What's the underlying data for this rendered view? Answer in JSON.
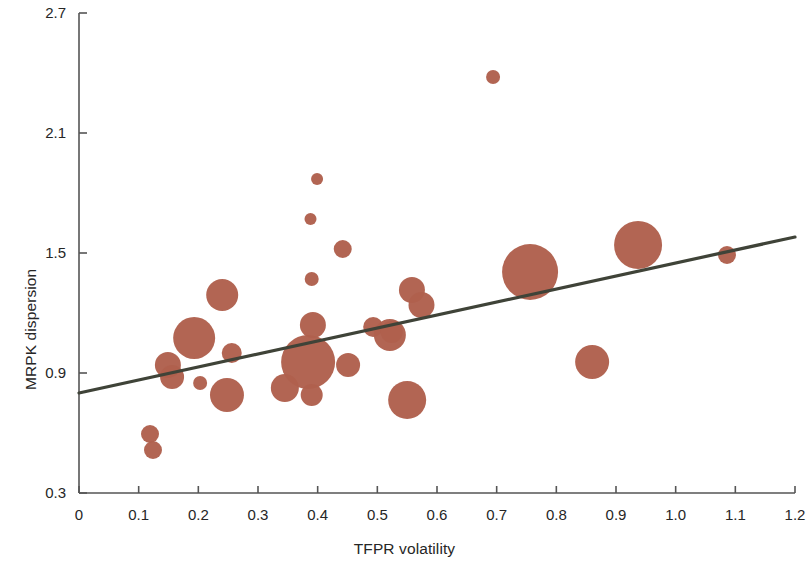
{
  "chart_data": {
    "type": "scatter",
    "title": "",
    "xlabel": "TFPR volatility",
    "ylabel": "MRPK dispersion",
    "xlim": [
      0,
      1.2
    ],
    "ylim": [
      0.3,
      2.7
    ],
    "xticks": [
      0,
      0.1,
      0.2,
      0.3,
      0.4,
      0.5,
      0.6,
      0.7,
      0.8,
      0.9,
      1.0,
      1.1,
      1.2
    ],
    "xticklabels": [
      "0",
      "0.1",
      "0.2",
      "0.3",
      "0.4",
      "0.5",
      "0.6",
      "0.7",
      "0.8",
      "0.9",
      "1.0",
      "1.1",
      "1.2"
    ],
    "yticks": [
      0.3,
      0.9,
      1.5,
      2.1,
      2.7
    ],
    "yticklabels": [
      "0.3",
      "0.9",
      "1.5",
      "2.1",
      "2.7"
    ],
    "grid": false,
    "legend": null,
    "marker_color": "#b0604d",
    "trendline_color": "#3f4338",
    "bubble_size_encodes": "weight",
    "trendline": {
      "x": [
        0,
        1.2
      ],
      "y": [
        0.8,
        1.58
      ]
    },
    "points": [
      {
        "x": 0.119,
        "y": 0.595,
        "r": 9
      },
      {
        "x": 0.124,
        "y": 0.515,
        "r": 9
      },
      {
        "x": 0.149,
        "y": 0.94,
        "r": 13
      },
      {
        "x": 0.156,
        "y": 0.88,
        "r": 12
      },
      {
        "x": 0.193,
        "y": 1.075,
        "r": 21
      },
      {
        "x": 0.203,
        "y": 0.85,
        "r": 7
      },
      {
        "x": 0.24,
        "y": 1.29,
        "r": 16
      },
      {
        "x": 0.256,
        "y": 1.0,
        "r": 10
      },
      {
        "x": 0.248,
        "y": 0.79,
        "r": 17
      },
      {
        "x": 0.345,
        "y": 0.825,
        "r": 14
      },
      {
        "x": 0.384,
        "y": 0.955,
        "r": 27
      },
      {
        "x": 0.39,
        "y": 0.79,
        "r": 11
      },
      {
        "x": 0.392,
        "y": 1.14,
        "r": 13
      },
      {
        "x": 0.39,
        "y": 1.37,
        "r": 7
      },
      {
        "x": 0.388,
        "y": 1.67,
        "r": 6
      },
      {
        "x": 0.399,
        "y": 1.87,
        "r": 6
      },
      {
        "x": 0.442,
        "y": 1.52,
        "r": 9
      },
      {
        "x": 0.451,
        "y": 0.94,
        "r": 12
      },
      {
        "x": 0.493,
        "y": 1.13,
        "r": 10
      },
      {
        "x": 0.521,
        "y": 1.09,
        "r": 16
      },
      {
        "x": 0.524,
        "y": 1.105,
        "r": 11
      },
      {
        "x": 0.558,
        "y": 1.315,
        "r": 13
      },
      {
        "x": 0.574,
        "y": 1.24,
        "r": 13
      },
      {
        "x": 0.55,
        "y": 0.765,
        "r": 19
      },
      {
        "x": 0.694,
        "y": 2.38,
        "r": 7
      },
      {
        "x": 0.756,
        "y": 1.405,
        "r": 28
      },
      {
        "x": 0.86,
        "y": 0.955,
        "r": 17
      },
      {
        "x": 0.937,
        "y": 1.54,
        "r": 24
      },
      {
        "x": 1.086,
        "y": 1.49,
        "r": 9
      }
    ]
  },
  "axes": {
    "x_title": "TFPR volatility",
    "y_title": "MRPK dispersion"
  }
}
